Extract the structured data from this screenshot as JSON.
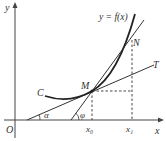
{
  "labels": {
    "y_axis": "y",
    "x_axis": "x",
    "origin": "O",
    "curve_name": "C",
    "function": "y = f(x)",
    "point_m": "M",
    "point_n": "N",
    "tangent": "T",
    "angle_alpha": "α",
    "angle_phi": "φ",
    "x0": "x₀",
    "x1": "x₁"
  }
}
